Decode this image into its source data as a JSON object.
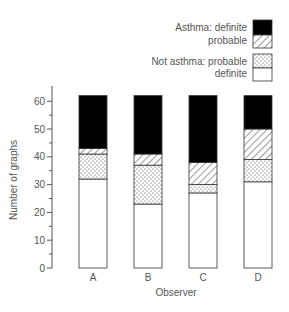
{
  "chart_data": {
    "type": "bar",
    "stacked": true,
    "title": "",
    "xlabel": "Observer",
    "ylabel": "Number of graphs",
    "ylim": [
      0,
      62
    ],
    "yticks": [
      0,
      10,
      20,
      30,
      40,
      50,
      60
    ],
    "grid": false,
    "legend_position": "top-right",
    "categories": [
      "A",
      "B",
      "C",
      "D"
    ],
    "series": [
      {
        "name": "Not asthma: definite",
        "pattern": "white",
        "values": [
          32,
          23,
          27,
          31
        ]
      },
      {
        "name": "Not asthma: probable",
        "pattern": "dotted",
        "values": [
          9,
          14,
          3,
          8
        ]
      },
      {
        "name": "Asthma: probable",
        "pattern": "hatched",
        "values": [
          2,
          4,
          8,
          11
        ]
      },
      {
        "name": "Asthma: definite",
        "pattern": "black",
        "values": [
          19,
          21,
          24,
          12
        ]
      }
    ]
  },
  "legend": {
    "asthma_definite": "Asthma: definite",
    "asthma_probable": "probable",
    "not_asthma_probable": "Not asthma: probable",
    "not_asthma_definite": "definite"
  },
  "axes": {
    "xlabel": "Observer",
    "ylabel": "Number of graphs",
    "ytick_labels": [
      "0",
      "10",
      "20",
      "30",
      "40",
      "50",
      "60"
    ],
    "xtick_labels": [
      "A",
      "B",
      "C",
      "D"
    ]
  },
  "colors": {
    "axis": "#555555",
    "black": "#000000",
    "white": "#ffffff"
  }
}
